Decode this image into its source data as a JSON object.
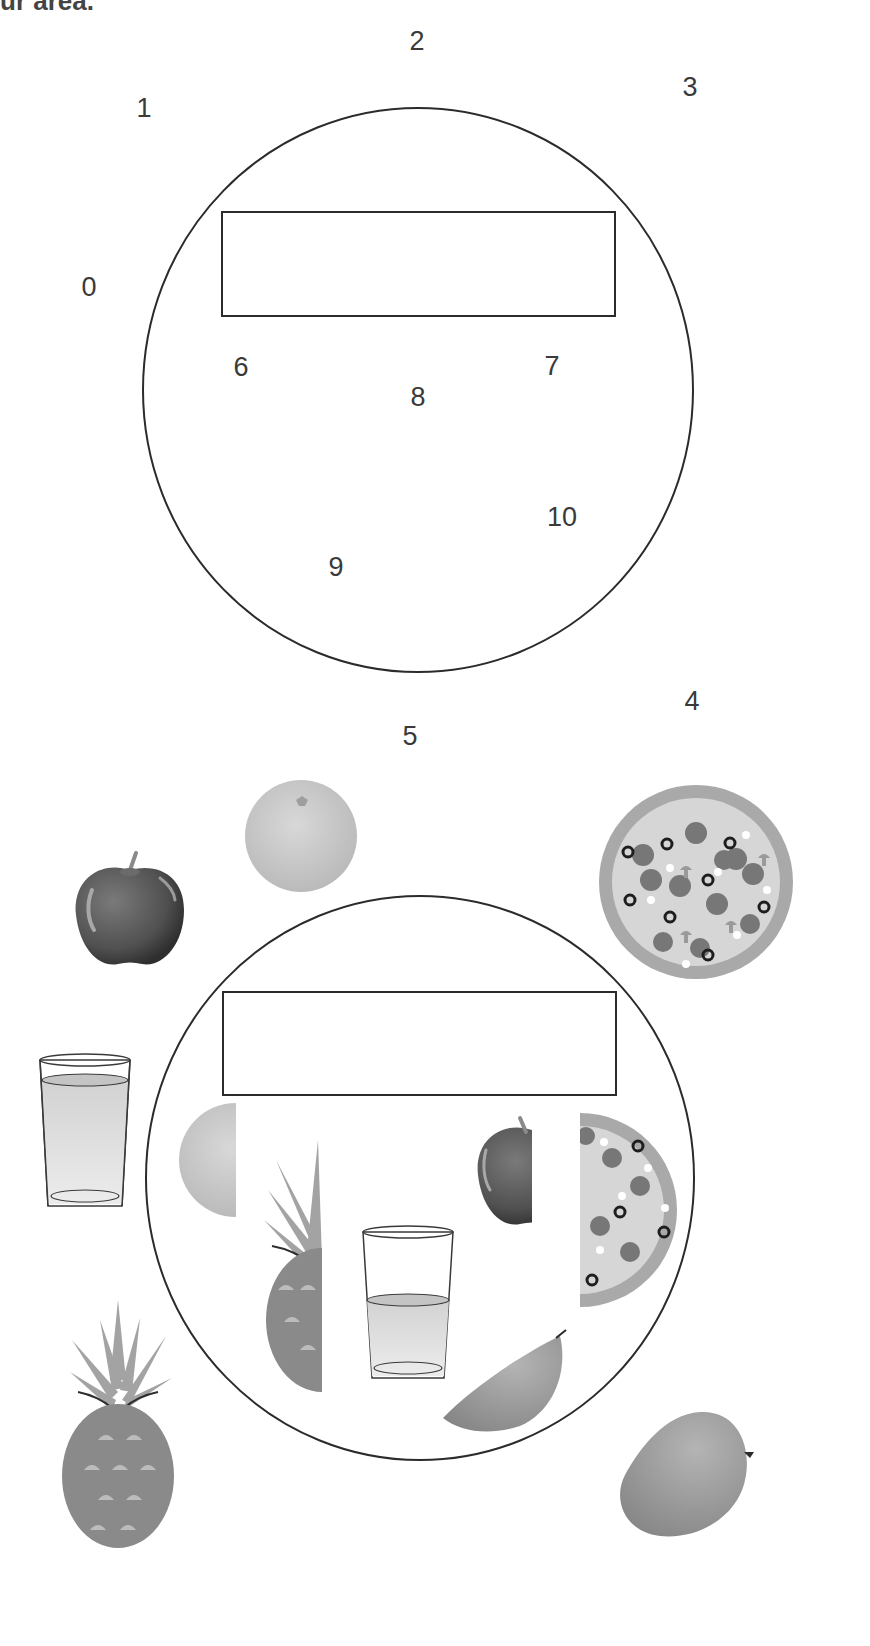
{
  "header": {
    "partial_title": "ur area."
  },
  "diagram_top": {
    "circle": {
      "cx": 418,
      "cy": 390,
      "rx": 275,
      "ry": 282
    },
    "rectangle": {
      "x": 222,
      "y": 212,
      "w": 393,
      "h": 104
    },
    "labels": [
      {
        "id": "0",
        "text": "0",
        "x": 89,
        "y": 287
      },
      {
        "id": "1",
        "text": "1",
        "x": 144,
        "y": 108
      },
      {
        "id": "2",
        "text": "2",
        "x": 417,
        "y": 41
      },
      {
        "id": "3",
        "text": "3",
        "x": 690,
        "y": 87
      },
      {
        "id": "4",
        "text": "4",
        "x": 692,
        "y": 701
      },
      {
        "id": "5",
        "text": "5",
        "x": 410,
        "y": 736
      },
      {
        "id": "6",
        "text": "6",
        "x": 241,
        "y": 367
      },
      {
        "id": "7",
        "text": "7",
        "x": 552,
        "y": 366
      },
      {
        "id": "8",
        "text": "8",
        "x": 418,
        "y": 397
      },
      {
        "id": "9",
        "text": "9",
        "x": 336,
        "y": 567
      },
      {
        "id": "10",
        "text": "10",
        "x": 562,
        "y": 517
      }
    ]
  },
  "diagram_bottom": {
    "circle": {
      "cx": 420,
      "cy": 1178,
      "rx": 274,
      "ry": 282
    },
    "rectangle": {
      "x": 223,
      "y": 992,
      "w": 393,
      "h": 103
    },
    "outside_items": [
      {
        "name": "apple",
        "x": 130,
        "y": 910
      },
      {
        "name": "orange",
        "x": 301,
        "y": 836
      },
      {
        "name": "pizza",
        "x": 696,
        "y": 882
      },
      {
        "name": "glass-of-juice",
        "x": 84,
        "y": 1130
      },
      {
        "name": "pineapple",
        "x": 118,
        "y": 1420
      },
      {
        "name": "mango",
        "x": 684,
        "y": 1465
      }
    ],
    "inside_items": [
      {
        "name": "half-orange",
        "x": 207,
        "y": 1160
      },
      {
        "name": "half-pineapple",
        "x": 295,
        "y": 1265
      },
      {
        "name": "half-glass-of-juice",
        "x": 408,
        "y": 1305
      },
      {
        "name": "half-apple",
        "x": 504,
        "y": 1175
      },
      {
        "name": "half-pizza",
        "x": 628,
        "y": 1210
      },
      {
        "name": "mango-slice",
        "x": 504,
        "y": 1370
      }
    ]
  },
  "colors": {
    "stroke": "#2b2b2b",
    "label": "#3a3a3a",
    "apple_dark": "#4a4a4a",
    "orange_light": "#c9c9c9",
    "pizza_crust": "#a9a9a9",
    "pizza_base": "#d6d6d6",
    "pepperoni": "#777777",
    "juice": "#dcdcdc",
    "pineapple_body": "#8a8a8a",
    "pineapple_leaves": "#a3a3a3",
    "mango": "#9c9c9c"
  }
}
